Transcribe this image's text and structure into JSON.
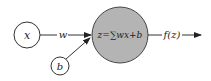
{
  "diagram": {
    "type": "neuron",
    "nodes": {
      "input": {
        "label": "x"
      },
      "bias": {
        "label": "b"
      },
      "neuron": {
        "label": "z=∑wx+b",
        "fill": "#b4b4b4"
      }
    },
    "edges": {
      "weight": {
        "label": "w"
      },
      "output": {
        "label": "f(z)"
      }
    }
  }
}
